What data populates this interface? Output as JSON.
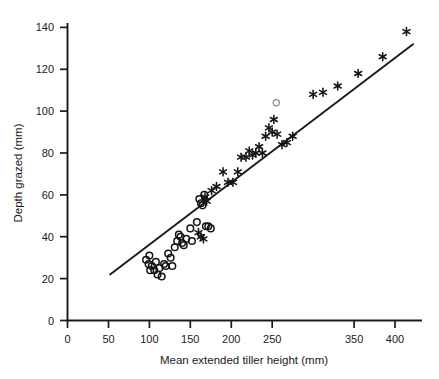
{
  "chart_data": {
    "type": "scatter",
    "title": "",
    "xlabel": "Mean extended tiller height (mm)",
    "ylabel": "Depth grazed (mm)",
    "xlim": [
      0,
      430
    ],
    "ylim": [
      0,
      145
    ],
    "grid": false,
    "legend_position": "none",
    "xticks": [
      0,
      50,
      100,
      150,
      200,
      250,
      300,
      400
    ],
    "xtick_labels": [
      "0",
      "50",
      "100",
      "150",
      "200",
      "250",
      "350",
      "400"
    ],
    "yticks": [
      0,
      20,
      40,
      60,
      80,
      100,
      120,
      140
    ],
    "ytick_labels": [
      "0",
      "20",
      "40",
      "60",
      "80",
      "100",
      "120",
      "140"
    ],
    "note_on_xticks": "tick at x=300 is labelled 350 in the original figure",
    "series": [
      {
        "name": "open-circle-series",
        "marker": "open-circle",
        "color": "#141414",
        "points": [
          [
            96,
            29
          ],
          [
            99,
            27
          ],
          [
            100,
            31
          ],
          [
            101,
            24
          ],
          [
            103,
            26
          ],
          [
            106,
            24
          ],
          [
            108,
            28
          ],
          [
            110,
            22
          ],
          [
            112,
            25
          ],
          [
            115,
            21
          ],
          [
            118,
            27
          ],
          [
            120,
            26
          ],
          [
            123,
            32
          ],
          [
            126,
            30
          ],
          [
            128,
            26
          ],
          [
            131,
            35
          ],
          [
            134,
            38
          ],
          [
            136,
            41
          ],
          [
            138,
            40
          ],
          [
            140,
            37
          ],
          [
            142,
            36
          ],
          [
            145,
            39
          ],
          [
            150,
            44
          ],
          [
            152,
            38
          ],
          [
            158,
            47
          ],
          [
            161,
            58
          ],
          [
            163,
            56
          ],
          [
            165,
            55
          ],
          [
            167,
            60
          ],
          [
            169,
            45
          ],
          [
            172,
            45
          ],
          [
            175,
            44
          ]
        ]
      },
      {
        "name": "asterisk-series",
        "marker": "asterisk",
        "color": "#141414",
        "points": [
          [
            160,
            42
          ],
          [
            163,
            40
          ],
          [
            166,
            39
          ],
          [
            168,
            59
          ],
          [
            170,
            57
          ],
          [
            176,
            62
          ],
          [
            182,
            64
          ],
          [
            190,
            71
          ],
          [
            196,
            66
          ],
          [
            202,
            66
          ],
          [
            208,
            71
          ],
          [
            212,
            78
          ],
          [
            218,
            78
          ],
          [
            222,
            81
          ],
          [
            226,
            79
          ],
          [
            230,
            80
          ],
          [
            234,
            83
          ],
          [
            238,
            80
          ],
          [
            242,
            88
          ],
          [
            246,
            92
          ],
          [
            250,
            90
          ],
          [
            252,
            96
          ],
          [
            256,
            89
          ],
          [
            262,
            84
          ],
          [
            268,
            85
          ],
          [
            275,
            88
          ],
          [
            300,
            108
          ],
          [
            312,
            109
          ],
          [
            330,
            112
          ],
          [
            355,
            118
          ],
          [
            385,
            126
          ],
          [
            414,
            138
          ]
        ]
      },
      {
        "name": "faint-open-circle",
        "marker": "open-circle-faint",
        "color": "#8a8a8a",
        "points": [
          [
            255,
            104
          ]
        ]
      }
    ],
    "fit_line": {
      "name": "regression-line",
      "x_start": 52,
      "y_start": 22,
      "x_end": 422,
      "y_end": 132,
      "slope": 0.297,
      "intercept": 6.55
    }
  }
}
